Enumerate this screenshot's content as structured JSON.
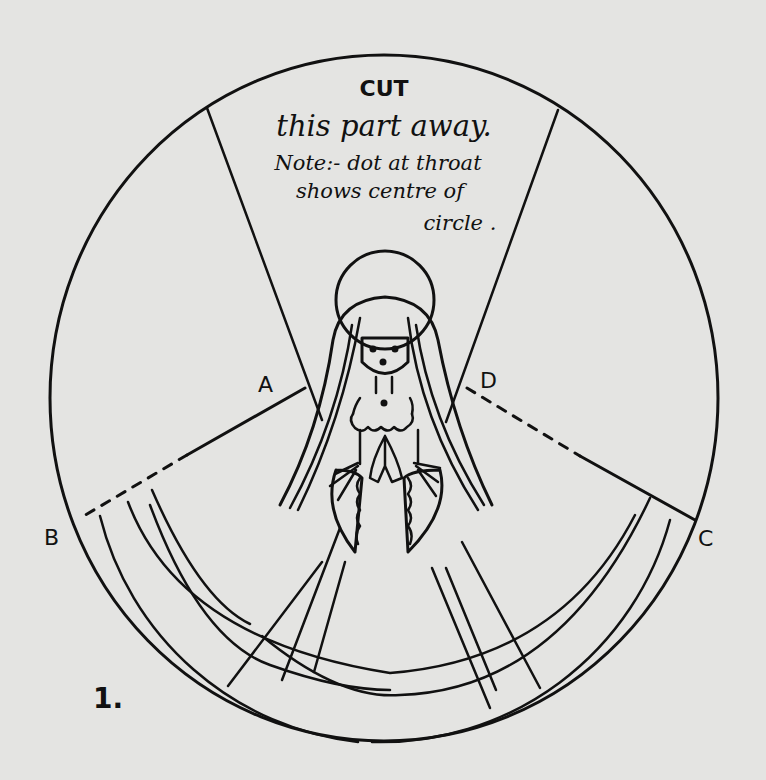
{
  "diagram": {
    "figure_number": "1.",
    "instructions": {
      "heading": "CUT",
      "line1": "this part away.",
      "line2": "Note:- dot at throat",
      "line3": "shows centre of",
      "line4": "circle ."
    },
    "labels": {
      "a": "A",
      "b": "B",
      "c": "C",
      "d": "D"
    },
    "colors": {
      "paper": "#e4e4e2",
      "ink": "#111111"
    }
  }
}
